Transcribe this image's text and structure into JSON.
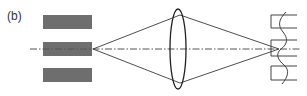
{
  "figure": {
    "panel_label": "(b)",
    "colors": {
      "background": "#ffffff",
      "slit_fill": "#6e6e6e",
      "line": "#3a3a3a",
      "axis": "#555555"
    },
    "components": [
      {
        "name": "source-slits",
        "description": "three gray rectangular slits stacked vertically"
      },
      {
        "name": "optical-axis",
        "description": "dash-dot horizontal centerline"
      },
      {
        "name": "converging-lens",
        "description": "biconvex lens (ellipse)"
      },
      {
        "name": "light-rays",
        "description": "ray cone from middle slit through lens converging at grating"
      },
      {
        "name": "grating-profile",
        "description": "square-wave grating with sinusoidal wave overlay"
      }
    ]
  }
}
